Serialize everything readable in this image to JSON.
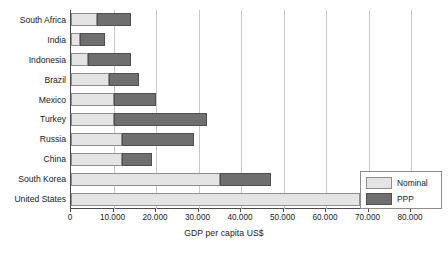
{
  "chart_data": {
    "type": "bar",
    "orientation": "horizontal",
    "stacked": true,
    "title": "",
    "xlabel": "GDP per capita US$",
    "ylabel": "",
    "xlim": [
      0,
      80000
    ],
    "grid": true,
    "legend_position": "bottom-right",
    "xticks": [
      0,
      10000,
      20000,
      30000,
      40000,
      50000,
      60000,
      70000,
      80000
    ],
    "xtick_labels": [
      "0",
      "10.000",
      "20.000",
      "30.000",
      "40.000",
      "50.000",
      "60.000",
      "70.000",
      "80.000"
    ],
    "categories": [
      "South Africa",
      "India",
      "Indonesia",
      "Brazil",
      "Mexico",
      "Turkey",
      "Russia",
      "China",
      "South Korea",
      "United States"
    ],
    "series": [
      {
        "name": "Nominal",
        "color": "#e4e4e4",
        "values": [
          6000,
          2000,
          4000,
          9000,
          10000,
          10000,
          12000,
          12000,
          35000,
          68000
        ]
      },
      {
        "name": "PPP",
        "color": "#6f6f6f",
        "values": [
          8000,
          6000,
          10000,
          7000,
          10000,
          22000,
          17000,
          7000,
          12000,
          0
        ]
      }
    ],
    "totals": [
      14000,
      8000,
      14000,
      16000,
      20000,
      32000,
      29000,
      19000,
      47000,
      68000
    ]
  },
  "legend": {
    "items": [
      {
        "label": "Nominal",
        "swatch": "light-gray-swatch"
      },
      {
        "label": "PPP",
        "swatch": "dark-gray-swatch"
      }
    ]
  },
  "colors": {
    "nominal": "#e4e4e4",
    "ppp": "#6f6f6f",
    "axis": "#4a4a4a",
    "grid": "#c9c9c9",
    "text": "#1a1a1a",
    "background": "#ffffff"
  }
}
